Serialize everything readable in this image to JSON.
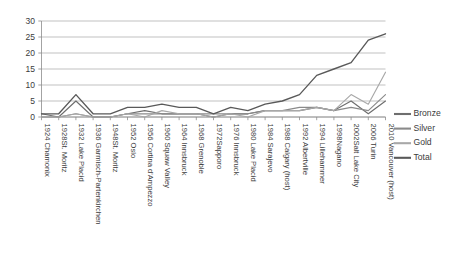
{
  "chart_data": {
    "type": "line",
    "title": "",
    "xlabel": "",
    "ylabel": "",
    "ylim": [
      0,
      30
    ],
    "yticks": [
      0,
      5,
      10,
      15,
      20,
      25,
      30
    ],
    "grid": true,
    "legend_position": "right",
    "categories": [
      "1924 Chamonix",
      "1928St. Moritz",
      "1932 Lake Placid",
      "1936 Garmisch-Partenkirchen",
      "1948St. Moritz",
      "1952 Oslo",
      "1956 Cortina d'Ampezzo",
      "1960 Squaw Valley",
      "1964 Innsbruck",
      "1968 Grenoble",
      "1972Sapporo",
      "1976 Innsbruck",
      "1980 Lake Placid",
      "1984 Sarajevo",
      "1988 Calgary (host)",
      "1992 Albertville",
      "1994 Lillehammer",
      "1998Nagano",
      "2002Salt Lake City",
      "2006 Turin",
      "2010 Vancouver (host)"
    ],
    "series": [
      {
        "name": "Bronze",
        "color": "#6e6e6e",
        "values": [
          1,
          0,
          5,
          0,
          0,
          1,
          2,
          1,
          1,
          1,
          0,
          1,
          1,
          2,
          2,
          2,
          3,
          2,
          5,
          1,
          5
        ]
      },
      {
        "name": "Silver",
        "color": "#8a8a8a",
        "values": [
          0,
          0,
          1,
          0,
          0,
          1,
          1,
          1,
          1,
          1,
          1,
          1,
          1,
          2,
          2,
          3,
          3,
          2,
          3,
          2,
          7
        ]
      },
      {
        "name": "Gold",
        "color": "#a8a8a8",
        "values": [
          0,
          0,
          1,
          0,
          0,
          1,
          0,
          2,
          1,
          1,
          0,
          1,
          0,
          2,
          2,
          2,
          3,
          2,
          7,
          4,
          14
        ]
      },
      {
        "name": "Total",
        "color": "#595959",
        "values": [
          1,
          1,
          7,
          1,
          1,
          3,
          3,
          4,
          3,
          3,
          1,
          3,
          2,
          4,
          5,
          7,
          13,
          15,
          17,
          24,
          26
        ]
      }
    ]
  },
  "legend": {
    "entries": [
      {
        "label": "Bronze"
      },
      {
        "label": "Silver"
      },
      {
        "label": "Gold"
      },
      {
        "label": "Total"
      }
    ]
  }
}
